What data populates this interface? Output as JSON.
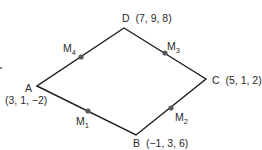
{
  "diagram": {
    "type": "quadrilateral",
    "colors": {
      "edge": "#1e1e1e",
      "point": "#5a5a5a",
      "text": "#2a2a2a"
    },
    "vertices": [
      {
        "id": "A",
        "name": "A",
        "coords": "(3, 1, −2)",
        "x": 37,
        "y": 86
      },
      {
        "id": "B",
        "name": "B",
        "coords": "(−1, 3, 6)",
        "x": 136,
        "y": 135
      },
      {
        "id": "C",
        "name": "C",
        "coords": "(5, 1, 2)",
        "x": 206,
        "y": 79
      },
      {
        "id": "D",
        "name": "D",
        "coords": "(7, 9, 8)",
        "x": 124,
        "y": 28
      }
    ],
    "midpoints": [
      {
        "id": "M1",
        "base": "M",
        "sub": "1",
        "edge": "AB"
      },
      {
        "id": "M2",
        "base": "M",
        "sub": "2",
        "edge": "BC"
      },
      {
        "id": "M3",
        "base": "M",
        "sub": "3",
        "edge": "CD"
      },
      {
        "id": "M4",
        "base": "M",
        "sub": "4",
        "edge": "DA"
      }
    ]
  }
}
